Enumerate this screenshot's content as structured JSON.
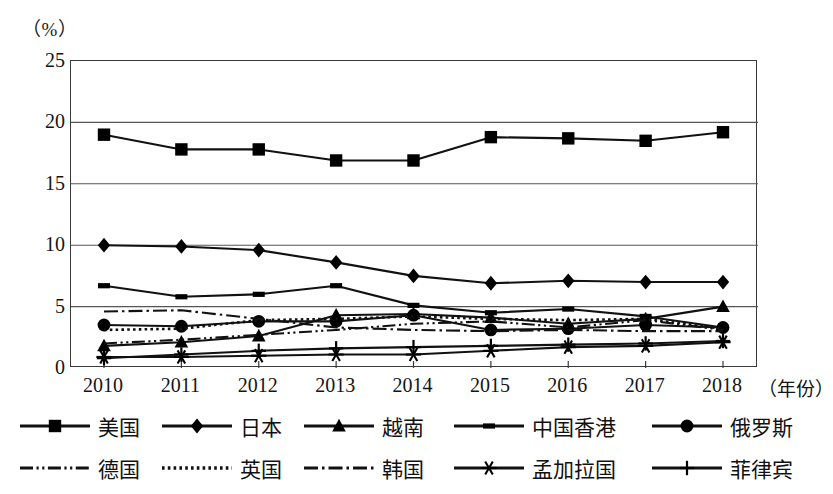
{
  "chart_data": {
    "type": "line",
    "title": "",
    "unit_label": "（%）",
    "xlabel": "（年份）",
    "ylabel": "",
    "categories": [
      2010,
      2011,
      2012,
      2013,
      2014,
      2015,
      2016,
      2017,
      2018
    ],
    "xtick_labels": [
      "2010",
      "2011",
      "2012",
      "2013",
      "2014",
      "2015",
      "2016",
      "2017",
      "2018"
    ],
    "ytick_labels": [
      "0",
      "5",
      "10",
      "15",
      "20",
      "25"
    ],
    "ytick_values": [
      0,
      5,
      10,
      15,
      20,
      25
    ],
    "ylim": [
      0,
      25
    ],
    "grid": "horizontal",
    "legend_position": "bottom",
    "series": [
      {
        "name": "美国",
        "marker": "square",
        "line": "solid",
        "values": [
          19.0,
          17.8,
          17.8,
          16.9,
          16.9,
          18.8,
          18.7,
          18.5,
          19.2
        ]
      },
      {
        "name": "日本",
        "marker": "diamond",
        "line": "solid",
        "values": [
          10.0,
          9.9,
          9.6,
          8.6,
          7.5,
          6.9,
          7.1,
          7.0,
          7.0
        ]
      },
      {
        "name": "越南",
        "marker": "triangle",
        "line": "solid",
        "values": [
          1.8,
          2.1,
          2.6,
          4.3,
          4.4,
          4.1,
          3.6,
          4.0,
          5.0
        ]
      },
      {
        "name": "中国香港",
        "marker": "minirect",
        "line": "solid",
        "values": [
          6.7,
          5.8,
          6.0,
          6.7,
          5.1,
          4.5,
          4.8,
          4.2,
          3.3
        ]
      },
      {
        "name": "俄罗斯",
        "marker": "circle",
        "line": "solid",
        "values": [
          3.5,
          3.4,
          3.8,
          3.8,
          4.3,
          3.1,
          3.2,
          3.5,
          3.3
        ]
      },
      {
        "name": "德国",
        "marker": "none",
        "line": "dash-dot-dot",
        "values": [
          2.0,
          2.3,
          2.7,
          3.1,
          3.6,
          3.8,
          3.3,
          3.9,
          3.1
        ]
      },
      {
        "name": "英国",
        "marker": "none",
        "line": "dotted",
        "values": [
          3.1,
          3.2,
          3.9,
          4.0,
          4.2,
          4.0,
          3.9,
          4.0,
          3.2
        ]
      },
      {
        "name": "韩国",
        "marker": "none",
        "line": "dash-dot",
        "values": [
          4.6,
          4.7,
          4.0,
          3.3,
          3.1,
          3.0,
          3.1,
          3.0,
          3.0
        ]
      },
      {
        "name": "孟加拉国",
        "marker": "asterisk",
        "line": "solid",
        "values": [
          0.9,
          0.9,
          1.0,
          1.1,
          1.1,
          1.4,
          1.7,
          1.8,
          2.1
        ]
      },
      {
        "name": "菲律宾",
        "marker": "plus",
        "line": "solid",
        "values": [
          0.8,
          1.1,
          1.4,
          1.6,
          1.7,
          1.8,
          1.9,
          2.0,
          2.2
        ]
      }
    ]
  },
  "legend": {
    "row1": [
      "美国",
      "日本",
      "越南",
      "中国香港",
      "俄罗斯"
    ],
    "row2": [
      "德国",
      "英国",
      "韩国",
      "孟加拉国",
      "菲律宾"
    ]
  },
  "colors": {
    "line": "#111111",
    "frame": "#3a3a3a",
    "grid": "#555555",
    "text": "#141414",
    "background": "#ffffff"
  }
}
